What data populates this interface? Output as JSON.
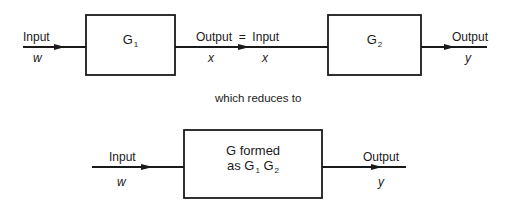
{
  "top_chain": {
    "input": {
      "label": "Input",
      "var": "w"
    },
    "block1": {
      "name": "G",
      "sub": "1"
    },
    "connector": {
      "label": "Output  =  Input",
      "var_left": "x",
      "var_right": "x"
    },
    "block2": {
      "name": "G",
      "sub": "2"
    },
    "output": {
      "label": "Output",
      "var": "y"
    }
  },
  "caption": "which reduces to",
  "reduced": {
    "input": {
      "label": "Input",
      "var": "w"
    },
    "block": {
      "line1": "G formed",
      "line2_prefix": "as G",
      "sub1": "1",
      "mid": "G",
      "sub2": "2"
    },
    "output": {
      "label": "Output",
      "var": "y"
    }
  },
  "colors": {
    "stroke": "#1a1a1a",
    "background": "#ffffff"
  }
}
